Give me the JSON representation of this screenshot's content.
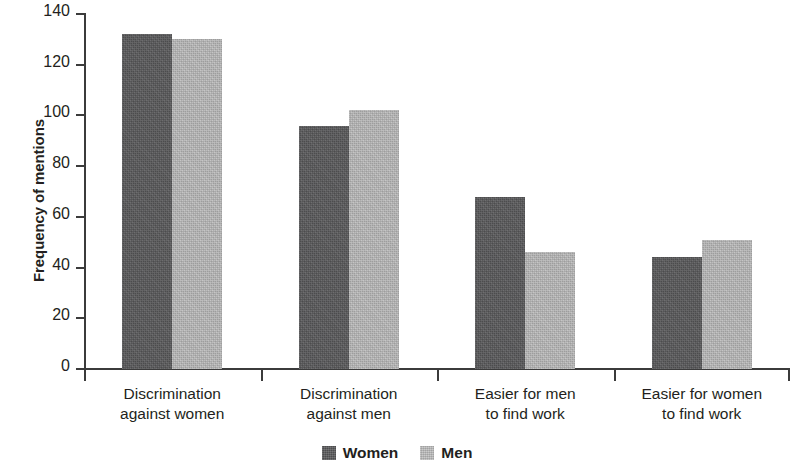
{
  "chart_data": {
    "type": "bar",
    "title": "",
    "xlabel": "",
    "ylabel": "Frequency of mentions",
    "ylim": [
      0,
      140
    ],
    "yticks": [
      0,
      20,
      40,
      60,
      80,
      100,
      120,
      140
    ],
    "ytick_labels": [
      "0",
      "20",
      "40",
      "60",
      "80",
      "100",
      "120",
      "140"
    ],
    "grid": false,
    "legend_position": "bottom-center",
    "categories": [
      "Discrimination against women",
      "Discrimination against men",
      "Easier for men to find work",
      "Easier for women to find work"
    ],
    "category_lines": [
      [
        "Discrimination",
        "against women"
      ],
      [
        "Discrimination",
        "against men"
      ],
      [
        "Easier for men",
        "to find work"
      ],
      [
        "Easier for women",
        "to find work"
      ]
    ],
    "series": [
      {
        "name": "Women",
        "color": "#58585a",
        "values": [
          132,
          96,
          68,
          44
        ]
      },
      {
        "name": "Men",
        "color": "#b6b6b6",
        "values": [
          130,
          102,
          46,
          51
        ]
      }
    ]
  },
  "legend": {
    "items": [
      {
        "label": "Women",
        "swatch": "women-swatch"
      },
      {
        "label": "Men",
        "swatch": "men-swatch"
      }
    ]
  },
  "axis": {
    "y_title": "Frequency of mentions"
  }
}
